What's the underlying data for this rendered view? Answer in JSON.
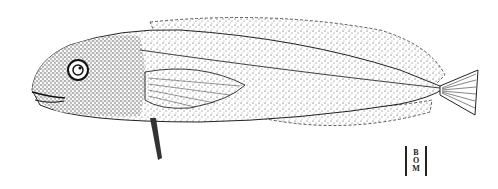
{
  "illustration": {
    "subject": "fish",
    "style": "stipple ink drawing",
    "colors": {
      "background": "#ffffff",
      "ink": "#1a1a1a"
    }
  },
  "monogram": {
    "letters": [
      "B",
      "O",
      "M"
    ]
  }
}
